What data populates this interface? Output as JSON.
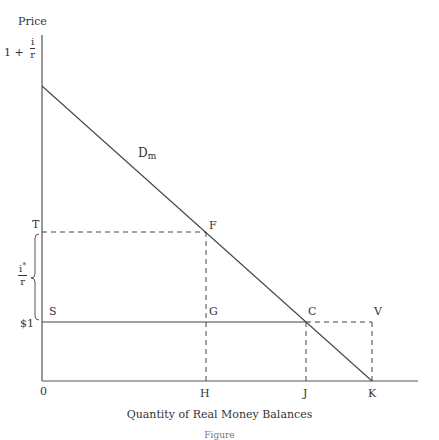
{
  "diagram": {
    "y_axis_label": "Price",
    "x_axis_label": "Quantity of Real Money Balances",
    "figure_caption": "Figure",
    "curve_label": {
      "main": "D",
      "sub": "m"
    },
    "y_ticks": {
      "top": {
        "prefix": "1 + ",
        "num": "i",
        "den": "r"
      },
      "T": "T",
      "bracket": {
        "num": "i",
        "sup": "*",
        "den": "r"
      },
      "dollar_one": "$1"
    },
    "x_ticks": {
      "origin": "0",
      "H": "H",
      "J": "J",
      "K": "K"
    },
    "points": {
      "T": "T",
      "F": "F",
      "S": "S",
      "G": "G",
      "C": "C",
      "V": "V"
    },
    "colors": {
      "line": "#444444",
      "text": "#333333"
    }
  }
}
